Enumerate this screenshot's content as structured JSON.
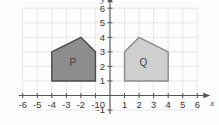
{
  "chart_data": {
    "type": "scatter",
    "title": "",
    "xlabel": "x",
    "ylabel": "y",
    "xlim": [
      -6,
      6
    ],
    "ylim": [
      -1,
      6
    ],
    "grid": true,
    "legend": false,
    "x_ticks": [
      "-6",
      "-5",
      "-4",
      "-3",
      "-2",
      "-1",
      "1",
      "2",
      "3",
      "4",
      "5",
      "6"
    ],
    "y_ticks": [
      "6",
      "5",
      "4",
      "3",
      "2",
      "1",
      "-1"
    ],
    "origin_label": "0",
    "shapes": [
      {
        "label": "P",
        "fill": "#8d8d8d",
        "stroke": "#4a4a4a",
        "label_x": -2.55,
        "label_y": 2.25,
        "points": [
          {
            "x": -4,
            "y": 1
          },
          {
            "x": -4,
            "y": 3
          },
          {
            "x": -2,
            "y": 4
          },
          {
            "x": -1,
            "y": 3
          },
          {
            "x": -1,
            "y": 1
          }
        ]
      },
      {
        "label": "Q",
        "fill": "#cfcfcf",
        "stroke": "#8a8a8a",
        "label_x": 2.3,
        "label_y": 2.3,
        "points": [
          {
            "x": 1,
            "y": 1
          },
          {
            "x": 1,
            "y": 3
          },
          {
            "x": 2,
            "y": 4
          },
          {
            "x": 4,
            "y": 3
          },
          {
            "x": 4,
            "y": 1
          }
        ]
      }
    ]
  },
  "axes": {
    "x_axis_label": "x",
    "y_axis_label": "y",
    "origin": "0",
    "x_labels": [
      {
        "text": "-6",
        "value": -6
      },
      {
        "text": "-5",
        "value": -5
      },
      {
        "text": "-4",
        "value": -4
      },
      {
        "text": "-3",
        "value": -3
      },
      {
        "text": "-2",
        "value": -2
      },
      {
        "text": "-1",
        "value": -1
      },
      {
        "text": "1",
        "value": 1
      },
      {
        "text": "2",
        "value": 2
      },
      {
        "text": "3",
        "value": 3
      },
      {
        "text": "4",
        "value": 4
      },
      {
        "text": "5",
        "value": 5
      },
      {
        "text": "6",
        "value": 6
      }
    ],
    "y_labels": [
      {
        "text": "6",
        "value": 6
      },
      {
        "text": "5",
        "value": 5
      },
      {
        "text": "4",
        "value": 4
      },
      {
        "text": "3",
        "value": 3
      },
      {
        "text": "2",
        "value": 2
      },
      {
        "text": "1",
        "value": 1
      },
      {
        "text": "-1",
        "value": -1
      }
    ]
  },
  "colors": {
    "grid": "#e3e3e3",
    "axis": "#555555",
    "background": "#fdfdfd",
    "shape_p_fill": "#8d8d8d",
    "shape_p_stroke": "#4a4a4a",
    "shape_q_fill": "#cfcfcf",
    "shape_q_stroke": "#8a8a8a"
  }
}
